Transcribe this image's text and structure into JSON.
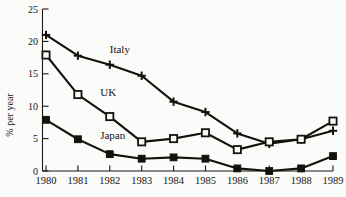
{
  "chart_data": {
    "type": "line",
    "title": "",
    "xlabel": "",
    "ylabel": "% per year",
    "categories": [
      "1980",
      "1981",
      "1982",
      "1983",
      "1984",
      "1985",
      "1986",
      "1987",
      "1988",
      "1989"
    ],
    "x": [
      1980,
      1981,
      1982,
      1983,
      1984,
      1985,
      1986,
      1987,
      1988,
      1989
    ],
    "xlim": [
      1980,
      1989
    ],
    "ylim": [
      0,
      25
    ],
    "yticks": [
      0,
      5,
      10,
      15,
      20,
      25
    ],
    "ytick_labels": [
      "0",
      "5",
      "10",
      "15",
      "20",
      "25"
    ],
    "grid": false,
    "legend": "inline-labels",
    "series": [
      {
        "name": "Italy",
        "marker": "plus",
        "values": [
          21.0,
          17.8,
          16.4,
          14.7,
          10.7,
          9.1,
          5.8,
          4.2,
          4.9,
          6.2
        ]
      },
      {
        "name": "UK",
        "marker": "open-square",
        "values": [
          17.9,
          11.8,
          8.4,
          4.5,
          5.0,
          5.9,
          3.3,
          4.5,
          4.9,
          7.7
        ]
      },
      {
        "name": "Japan",
        "marker": "filled-square",
        "values": [
          7.9,
          4.9,
          2.6,
          1.9,
          2.1,
          1.9,
          0.4,
          0.0,
          0.4,
          2.3
        ]
      }
    ],
    "annotations": [
      {
        "text": "Italy",
        "x": 1982.0,
        "y": 18.2
      },
      {
        "text": "UK",
        "x": 1981.7,
        "y": 11.6
      },
      {
        "text": "Japan",
        "x": 1981.7,
        "y": 5.0
      }
    ]
  },
  "axis": {
    "y_title": "% per year"
  }
}
